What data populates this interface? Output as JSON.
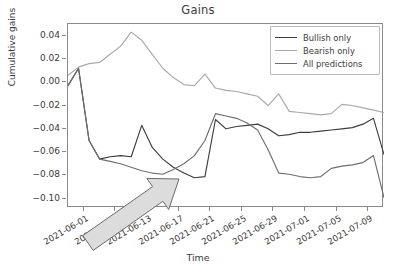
{
  "chart_data": {
    "type": "line",
    "title": "Gains",
    "xlabel": "Time",
    "ylabel": "Cumulative gains",
    "grid": false,
    "legend_position": "upper right",
    "ylim": [
      -0.108,
      0.05
    ],
    "yticks": [
      0.04,
      0.02,
      0.0,
      -0.02,
      -0.04,
      -0.06,
      -0.08,
      -0.1
    ],
    "ytick_labels": [
      "0.04",
      "0.02",
      "0.00",
      "−0.02",
      "−0.04",
      "−0.06",
      "−0.08",
      "−0.10"
    ],
    "xtick_labels": [
      "2021-06-01",
      "2021-06-05",
      "2021-06-13",
      "2021-06-17",
      "2021-06-21",
      "2021-06-25",
      "2021-06-29",
      "2021-07-01",
      "2021-07-05",
      "2021-07-09"
    ],
    "x": [
      0,
      1,
      2,
      3,
      4,
      5,
      6,
      7,
      8,
      9,
      10,
      11,
      12,
      13,
      14,
      15,
      16,
      17,
      18,
      19,
      20,
      21,
      22,
      23,
      24,
      25,
      26,
      27,
      28,
      29,
      30
    ],
    "x_range": [
      0,
      30
    ],
    "series": [
      {
        "name": "Bullish only",
        "color": "#3d3d3d",
        "values": [
          -0.003,
          0.012,
          -0.05,
          -0.066,
          -0.064,
          -0.063,
          -0.064,
          -0.037,
          -0.056,
          -0.066,
          -0.073,
          -0.078,
          -0.082,
          -0.081,
          -0.032,
          -0.04,
          -0.038,
          -0.037,
          -0.036,
          -0.04,
          -0.046,
          -0.045,
          -0.043,
          -0.043,
          -0.042,
          -0.041,
          -0.04,
          -0.039,
          -0.036,
          -0.031,
          -0.062
        ]
      },
      {
        "name": "Bearish only",
        "color": "#a9a9a9",
        "values": [
          0.006,
          0.013,
          0.016,
          0.017,
          0.024,
          0.031,
          0.043,
          0.036,
          0.024,
          0.012,
          0.004,
          -0.002,
          -0.003,
          0.007,
          -0.005,
          -0.007,
          -0.008,
          -0.01,
          -0.012,
          -0.02,
          -0.01,
          -0.025,
          -0.026,
          -0.027,
          -0.028,
          -0.027,
          -0.019,
          -0.02,
          -0.022,
          -0.024,
          -0.026
        ]
      },
      {
        "name": "All predictions",
        "color": "#6e6e6e",
        "values": [
          -0.003,
          0.012,
          -0.05,
          -0.066,
          -0.068,
          -0.07,
          -0.073,
          -0.076,
          -0.078,
          -0.079,
          -0.075,
          -0.07,
          -0.063,
          -0.05,
          -0.027,
          -0.029,
          -0.031,
          -0.035,
          -0.041,
          -0.058,
          -0.078,
          -0.079,
          -0.081,
          -0.082,
          -0.081,
          -0.074,
          -0.072,
          -0.071,
          -0.069,
          -0.063,
          -0.099
        ]
      }
    ],
    "annotation": {
      "name": "trend-arrow",
      "kind": "arrow",
      "direction": "up-right",
      "fill": "#dcdcdc",
      "stroke": "#6b6b6b",
      "tail": [
        88,
        243
      ],
      "tip": [
        179,
        179
      ]
    }
  }
}
